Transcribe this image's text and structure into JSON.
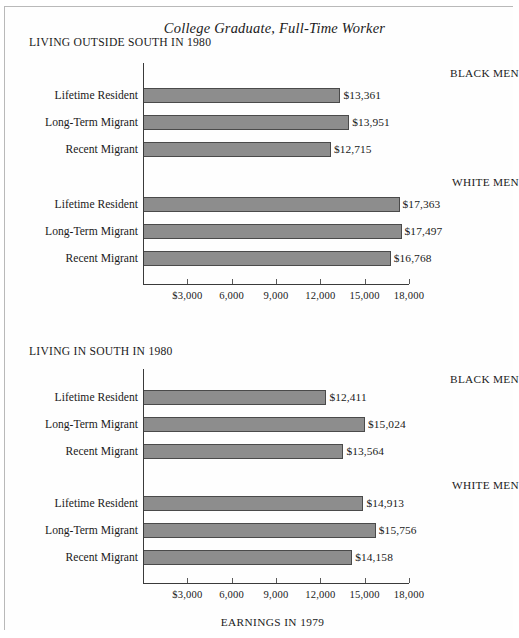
{
  "figure": {
    "title": "College Graduate, Full-Time Worker",
    "axis_caption": "EARNINGS IN 1979"
  },
  "chart_data": {
    "type": "bar",
    "orientation": "horizontal",
    "title": "College Graduate, Full-Time Worker",
    "xlabel": "EARNINGS IN 1979",
    "ylabel": "",
    "xlim": [
      0,
      18000
    ],
    "xticks": [
      3000,
      6000,
      9000,
      12000,
      15000,
      18000
    ],
    "xticklabels": [
      "$3,000",
      "6,000",
      "9,000",
      "12,000",
      "15,000",
      "18,000"
    ],
    "grid": false,
    "legend": false,
    "bar_color": "#8d8d8d",
    "panels": [
      {
        "panel_title": "LIVING OUTSIDE SOUTH IN 1980",
        "groups": [
          {
            "group_label": "BLACK MEN",
            "categories": [
              "Lifetime Resident",
              "Long-Term Migrant",
              "Recent Migrant"
            ],
            "values": [
              13361,
              13951,
              12715
            ],
            "value_labels": [
              "$13,361",
              "$13,951",
              "$12,715"
            ]
          },
          {
            "group_label": "WHITE MEN",
            "categories": [
              "Lifetime Resident",
              "Long-Term Migrant",
              "Recent Migrant"
            ],
            "values": [
              17363,
              17497,
              16768
            ],
            "value_labels": [
              "$17,363",
              "$17,497",
              "$16,768"
            ]
          }
        ]
      },
      {
        "panel_title": "LIVING IN SOUTH IN 1980",
        "groups": [
          {
            "group_label": "BLACK MEN",
            "categories": [
              "Lifetime Resident",
              "Long-Term Migrant",
              "Recent Migrant"
            ],
            "values": [
              12411,
              15024,
              13564
            ],
            "value_labels": [
              "$12,411",
              "$15,024",
              "$13,564"
            ]
          },
          {
            "group_label": "WHITE MEN",
            "categories": [
              "Lifetime Resident",
              "Long-Term Migrant",
              "Recent Migrant"
            ],
            "values": [
              14913,
              15756,
              14158
            ],
            "value_labels": [
              "$14,913",
              "$15,756",
              "$14,158"
            ]
          }
        ]
      }
    ]
  }
}
